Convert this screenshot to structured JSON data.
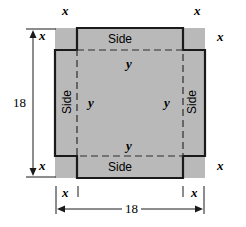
{
  "figure": {
    "colors": {
      "fill": "#b9b9b9",
      "stroke": "#1a1a1a",
      "dash": "#333333",
      "background": "#ffffff",
      "text": "#000000"
    },
    "geometry": {
      "outer_square": {
        "x": 55,
        "y": 28,
        "width": 150,
        "height": 150
      },
      "corner_cut": 22,
      "inner_dashed": {
        "x": 78,
        "y": 50,
        "width": 104,
        "height": 106
      }
    },
    "dimensions": {
      "vertical_label": "18",
      "horizontal_label": "18"
    },
    "corner_labels": {
      "top_left_outer": "x",
      "top_right_outer": "x",
      "left_upper": "x",
      "right_upper": "x",
      "left_lower": "x",
      "right_lower": "x",
      "bottom_left_outer": "x",
      "bottom_right_outer": "x"
    },
    "flap_labels": {
      "top": "Side",
      "left": "Side",
      "right": "Side",
      "bottom": "Side"
    },
    "base_labels": {
      "top": "y",
      "left": "y",
      "right": "y",
      "bottom": "y"
    }
  }
}
